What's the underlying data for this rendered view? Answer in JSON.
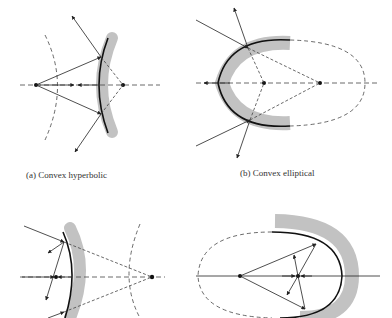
{
  "figure": {
    "panels": [
      {
        "id": "a",
        "caption": "(a) Convex hyperbolic"
      },
      {
        "id": "b",
        "caption": "(b) Convex elliptical"
      },
      {
        "id": "c",
        "caption": ""
      },
      {
        "id": "d",
        "caption": ""
      }
    ],
    "colors": {
      "mirror_shade": "#c2c2c2",
      "line": "#222222",
      "dashed": "#444444"
    }
  }
}
